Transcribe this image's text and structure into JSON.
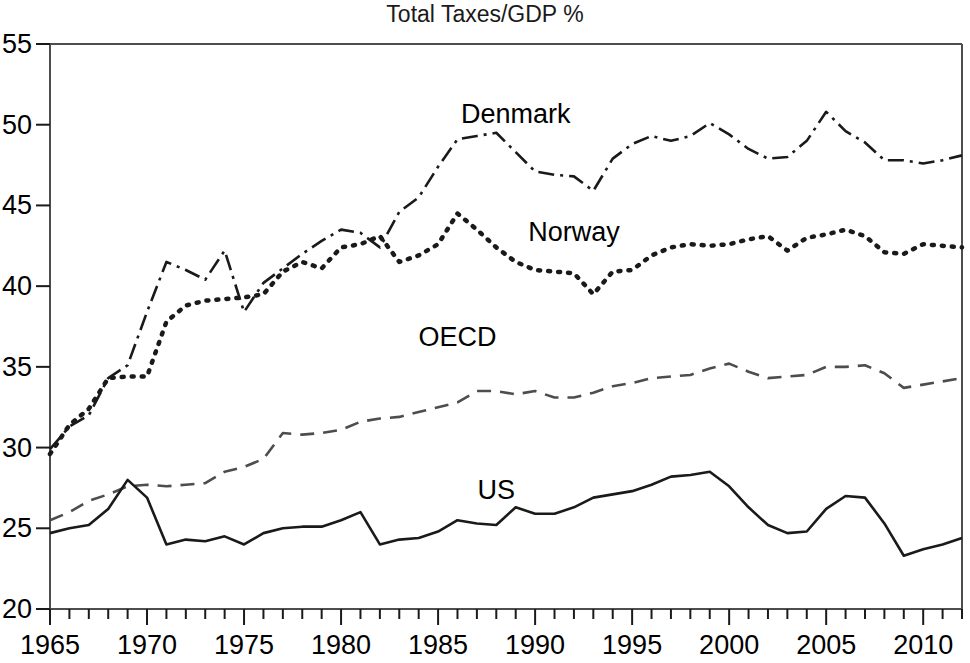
{
  "chart_data": {
    "type": "line",
    "title": "Total Taxes/GDP %",
    "xlabel": "",
    "ylabel": "",
    "xlim": [
      1965,
      2012
    ],
    "ylim": [
      20,
      55
    ],
    "grid": false,
    "legend_position": "inline-annotations",
    "x_ticks_major": [
      1965,
      1970,
      1975,
      1980,
      1985,
      1990,
      1995,
      2000,
      2005,
      2010
    ],
    "x_tick_labels": [
      "1965",
      "1970",
      "1975",
      "1980",
      "1985",
      "1990",
      "1995",
      "2000",
      "2005",
      "2010"
    ],
    "x_minor_tick_step": 1,
    "y_ticks": [
      20,
      25,
      30,
      35,
      40,
      45,
      50,
      55
    ],
    "y_tick_labels": [
      "20",
      "25",
      "30",
      "35",
      "40",
      "45",
      "50",
      "55"
    ],
    "x": [
      1965,
      1966,
      1967,
      1968,
      1969,
      1970,
      1971,
      1972,
      1973,
      1974,
      1975,
      1976,
      1977,
      1978,
      1979,
      1980,
      1981,
      1982,
      1983,
      1984,
      1985,
      1986,
      1987,
      1988,
      1989,
      1990,
      1991,
      1992,
      1993,
      1994,
      1995,
      1996,
      1997,
      1998,
      1999,
      2000,
      2001,
      2002,
      2003,
      2004,
      2005,
      2006,
      2007,
      2008,
      2009,
      2010,
      2011,
      2012
    ],
    "series": [
      {
        "name": "Denmark",
        "style": "dash-dot",
        "color": "#1a1a1a",
        "label_x": 1989,
        "label_y": 50.1,
        "values": [
          29.9,
          31.3,
          32.0,
          34.3,
          35.1,
          38.4,
          41.5,
          41.0,
          40.4,
          42.2,
          38.4,
          40.2,
          41.1,
          42.0,
          42.8,
          43.5,
          43.3,
          42.4,
          44.6,
          45.5,
          47.4,
          49.1,
          49.3,
          49.5,
          48.3,
          47.1,
          46.9,
          46.8,
          45.9,
          47.9,
          48.8,
          49.3,
          49.0,
          49.3,
          50.1,
          49.4,
          48.5,
          47.9,
          48.0,
          49.0,
          50.8,
          49.6,
          48.9,
          47.8,
          47.8,
          47.6,
          47.8,
          48.1
        ]
      },
      {
        "name": "Norway",
        "style": "dotted",
        "color": "#1a1a1a",
        "label_x": 1992,
        "label_y": 42.8,
        "values": [
          29.6,
          31.4,
          32.4,
          34.3,
          34.4,
          34.4,
          37.8,
          38.8,
          39.1,
          39.2,
          39.3,
          39.5,
          40.9,
          41.5,
          41.1,
          42.4,
          42.6,
          43.1,
          41.5,
          41.9,
          42.6,
          44.5,
          43.5,
          42.4,
          41.5,
          41.0,
          40.9,
          40.8,
          39.5,
          40.9,
          41.0,
          41.9,
          42.4,
          42.6,
          42.5,
          42.6,
          42.9,
          43.1,
          42.2,
          43.0,
          43.2,
          43.5,
          43.1,
          42.1,
          42.0,
          42.6,
          42.5,
          42.4
        ]
      },
      {
        "name": "OECD",
        "style": "dashed",
        "color": "#4d4d4d",
        "label_x": 1986,
        "label_y": 36.3,
        "values": [
          25.5,
          26.0,
          26.7,
          27.1,
          27.6,
          27.7,
          27.6,
          27.7,
          27.8,
          28.5,
          28.8,
          29.3,
          30.9,
          30.8,
          30.9,
          31.1,
          31.6,
          31.8,
          31.9,
          32.2,
          32.5,
          32.8,
          33.5,
          33.5,
          33.3,
          33.5,
          33.1,
          33.1,
          33.4,
          33.8,
          34.0,
          34.3,
          34.4,
          34.5,
          34.9,
          35.2,
          34.7,
          34.3,
          34.4,
          34.5,
          35.0,
          35.0,
          35.1,
          34.6,
          33.7,
          33.9,
          34.1,
          34.3
        ]
      },
      {
        "name": "US",
        "style": "solid",
        "color": "#1a1a1a",
        "label_x": 1988,
        "label_y": 26.8,
        "values": [
          24.7,
          25.0,
          25.2,
          26.2,
          28.0,
          26.9,
          24.0,
          24.3,
          24.2,
          24.5,
          24.0,
          24.7,
          25.0,
          25.1,
          25.1,
          25.5,
          26.0,
          24.0,
          24.3,
          24.4,
          24.8,
          25.5,
          25.3,
          25.2,
          26.3,
          25.9,
          25.9,
          26.3,
          26.9,
          27.1,
          27.3,
          27.7,
          28.2,
          28.3,
          28.5,
          27.6,
          26.3,
          25.2,
          24.7,
          24.8,
          26.2,
          27.0,
          26.9,
          25.3,
          23.3,
          23.7,
          24.0,
          24.4
        ]
      }
    ]
  },
  "annotations": {
    "denmark_label": "Denmark",
    "norway_label": "Norway",
    "oecd_label": "OECD",
    "us_label": "US"
  }
}
